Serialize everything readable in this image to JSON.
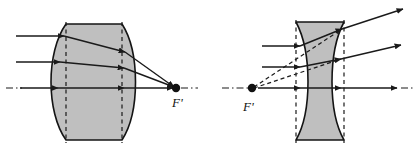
{
  "figure": {
    "background_color": "#ffffff",
    "ink_color": "#1a1a1a",
    "glass_fill_color": "#bfbfbf",
    "glass_stroke_color": "#141414",
    "width": 414,
    "height": 150
  },
  "panels": [
    {
      "id": "converging-lens-panel",
      "name": "converging lens",
      "lens_type": "biconvex",
      "behavior": "converging",
      "optical_axis_y": 88,
      "focal_point": {
        "label": "F'",
        "label_x": 178,
        "label_y": 105,
        "x": 174,
        "y": 88,
        "dot_radius": 4.2
      },
      "lens": {
        "left_vertex_x": 66,
        "right_vertex_x": 122,
        "left_bulge_x": 50,
        "right_bulge_x": 138,
        "top_y": 24,
        "bottom_y": 140
      },
      "dashed_lines_x": [
        66,
        122
      ],
      "incoming_rays": [
        {
          "y": 36,
          "start_x": 16,
          "end_x": 64
        },
        {
          "y": 62,
          "start_x": 16,
          "end_x": 60
        },
        {
          "y": 88,
          "start_x": 16,
          "end_x": 58,
          "is_axis": true
        }
      ],
      "internal_rays": [
        {
          "from_x": 64,
          "from_y": 36,
          "to_x": 125,
          "to_y": 52
        },
        {
          "from_x": 60,
          "from_y": 62,
          "to_x": 124,
          "to_y": 68
        },
        {
          "from_x": 58,
          "from_y": 88,
          "to_x": 124,
          "to_y": 88
        }
      ],
      "outgoing_rays": [
        {
          "from_x": 125,
          "from_y": 52,
          "to_x": 173,
          "to_y": 87
        },
        {
          "from_x": 124,
          "from_y": 68,
          "to_x": 173,
          "to_y": 87
        },
        {
          "from_x": 124,
          "from_y": 88,
          "to_x": 172,
          "to_y": 88
        }
      ],
      "axis_extension": {
        "from_x": 178,
        "to_x": 196,
        "y": 88
      }
    },
    {
      "id": "diverging-lens-panel",
      "name": "diverging lens",
      "lens_type": "biconcave",
      "behavior": "diverging",
      "optical_axis_y": 88,
      "focal_point": {
        "label": "F'",
        "label_x": 246,
        "label_y": 110,
        "x": 252,
        "y": 88,
        "dot_radius": 4.2
      },
      "lens": {
        "left_vertex_x": 309,
        "right_vertex_x": 331,
        "left_edge_x": 296,
        "right_edge_x": 344,
        "top_y": 22,
        "bottom_y": 140
      },
      "dashed_lines_x": [
        296,
        344
      ],
      "incoming_rays": [
        {
          "y": 46,
          "start_x": 262,
          "end_x": 300
        },
        {
          "y": 67,
          "start_x": 262,
          "end_x": 300
        },
        {
          "y": 88,
          "start_x": 258,
          "end_x": 300,
          "is_axis": true
        }
      ],
      "internal_rays": [
        {
          "from_x": 300,
          "from_y": 46,
          "to_x": 342,
          "to_y": 29
        },
        {
          "from_x": 300,
          "from_y": 67,
          "to_x": 341,
          "to_y": 59
        },
        {
          "from_x": 300,
          "from_y": 88,
          "to_x": 341,
          "to_y": 88
        }
      ],
      "outgoing_rays": [
        {
          "from_x": 342,
          "from_y": 29,
          "to_x": 402,
          "to_y": 9
        },
        {
          "from_x": 341,
          "from_y": 59,
          "to_x": 400,
          "to_y": 45
        },
        {
          "from_x": 341,
          "from_y": 88,
          "to_x": 396,
          "to_y": 88
        }
      ],
      "virtual_back_rays": [
        {
          "from_x": 253,
          "from_y": 87,
          "to_x": 342,
          "to_y": 29
        },
        {
          "from_x": 253,
          "from_y": 88,
          "to_x": 341,
          "to_y": 59
        }
      ],
      "axis_extension_left": {
        "from_x": 228,
        "to_x": 248,
        "y": 88
      },
      "axis_extension_right": {
        "from_x": 400,
        "to_x": 412,
        "y": 88
      }
    }
  ],
  "labels": {
    "converging_focal": "F'",
    "diverging_focal": "F'"
  }
}
